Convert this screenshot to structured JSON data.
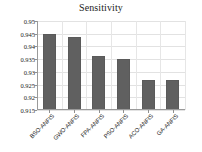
{
  "chart_data": {
    "type": "bar",
    "title": "Sensitivity",
    "xlabel": "",
    "ylabel": "",
    "categories": [
      "BSO-ANFIS",
      "GWO-ANFIS",
      "FPA-ANFIS",
      "PSO-ANFIS",
      "ACO-ANFIS",
      "GA-ANFIS"
    ],
    "values": [
      0.9447,
      0.9438,
      0.9362,
      0.935,
      0.9268,
      0.9268
    ],
    "ylim": [
      0.915,
      0.95
    ],
    "yticks": [
      0.915,
      0.92,
      0.925,
      0.93,
      0.935,
      0.94,
      0.945,
      0.95
    ],
    "ytick_labels": [
      "0.915",
      "0.92",
      "0.925",
      "0.93",
      "0.935",
      "0.94",
      "0.945",
      "0.95"
    ],
    "grid": true,
    "legend": false,
    "bar_color": "#606060",
    "series": [
      {
        "name": "Sensitivity",
        "values": [
          0.9447,
          0.9438,
          0.9362,
          0.935,
          0.9268,
          0.9268
        ]
      }
    ]
  }
}
